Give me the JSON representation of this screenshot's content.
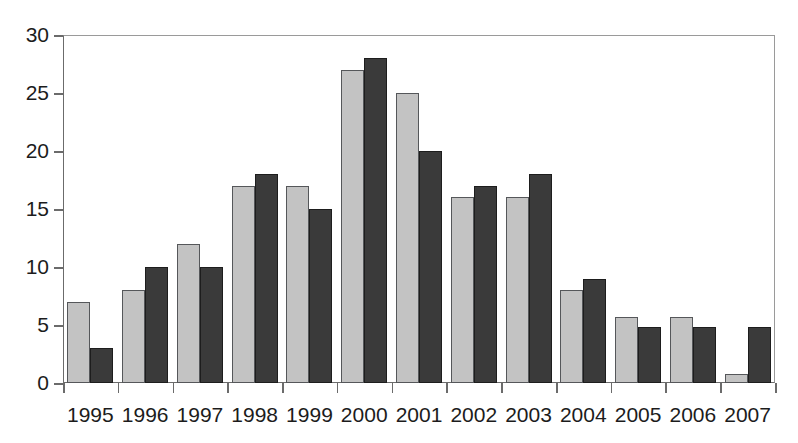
{
  "chart_data": {
    "type": "bar",
    "title": "",
    "subtitle": "",
    "xlabel": "",
    "ylabel": "",
    "categories": [
      "1995",
      "1996",
      "1997",
      "1998",
      "1999",
      "2000",
      "2001",
      "2002",
      "2003",
      "2004",
      "2005",
      "2006",
      "2007"
    ],
    "series": [
      {
        "name": "light-gray-series",
        "color": "#c3c3c3",
        "values": [
          7,
          8,
          12,
          17,
          17,
          27,
          25,
          16,
          16,
          8,
          5.7,
          5.7,
          0.8
        ]
      },
      {
        "name": "dark-gray-series",
        "color": "#3a3a3a",
        "values": [
          3,
          10,
          10,
          18,
          15,
          28,
          20,
          17,
          18,
          9,
          4.8,
          4.8,
          4.8
        ]
      }
    ],
    "ylim": [
      0,
      30
    ],
    "y_ticks": [
      0,
      5,
      10,
      15,
      20,
      25,
      30
    ],
    "y_tick_labels": [
      "0",
      "5",
      "10",
      "15",
      "20",
      "25",
      "30"
    ],
    "grid": false,
    "legend": null,
    "legend_position": "none",
    "annotations": []
  },
  "colors": {
    "background": "#ffffff",
    "axis": "#6b6b6b",
    "frame": "#9a9a9a",
    "text": "#1c1c1c",
    "series_light": "#c3c3c3",
    "series_dark": "#3a3a3a"
  }
}
